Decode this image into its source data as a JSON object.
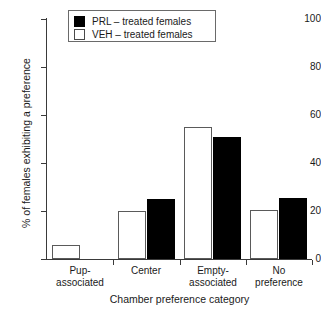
{
  "chart_data": {
    "type": "bar",
    "title": "",
    "xlabel": "Chamber preference category",
    "ylabel": "% of females exhibiting a preference",
    "categories": [
      "Pup-associated",
      "Center",
      "Empty-associated",
      "No preference"
    ],
    "category_lines": [
      [
        "Pup-",
        "associated"
      ],
      [
        "Center",
        ""
      ],
      [
        "Empty-",
        "associated"
      ],
      [
        "No",
        "preference"
      ]
    ],
    "series": [
      {
        "name": "VEH – treated females",
        "color": "#ffffff",
        "values": [
          6,
          20,
          55,
          20.5
        ]
      },
      {
        "name": "PRL – treated females",
        "color": "#000000",
        "values": [
          0,
          25,
          51,
          25.5
        ]
      }
    ],
    "ylim": [
      0,
      100
    ],
    "yticks": [
      0,
      20,
      40,
      60,
      80,
      100
    ],
    "ytick_labels": [
      "0",
      "20",
      "40",
      "60",
      "80",
      "100"
    ],
    "grid": false,
    "legend_position": "top-center",
    "bar_order": [
      "VEH",
      "PRL"
    ]
  },
  "legend": {
    "entries": [
      {
        "label": "PRL – treated females",
        "swatch": "filled-black"
      },
      {
        "label": "VEH – treated females",
        "swatch": "open-white"
      }
    ]
  }
}
